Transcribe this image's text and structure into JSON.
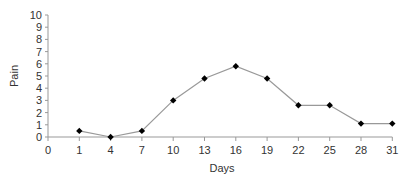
{
  "chart_data": {
    "type": "line",
    "title": "",
    "xlabel": "Days",
    "ylabel": "Pain",
    "categories": [
      "0",
      "1",
      "4",
      "7",
      "10",
      "13",
      "16",
      "19",
      "22",
      "25",
      "28",
      "31"
    ],
    "series": [
      {
        "name": "Pain",
        "x": [
          "1",
          "4",
          "7",
          "10",
          "13",
          "16",
          "19",
          "22",
          "25",
          "28",
          "31"
        ],
        "values": [
          0.5,
          0.0,
          0.5,
          3.0,
          4.8,
          5.8,
          4.8,
          2.6,
          2.6,
          1.1,
          1.1
        ],
        "color": "#999999",
        "marker": "diamond",
        "marker_color": "#000000"
      }
    ],
    "ylim": [
      0,
      10
    ],
    "yticks": [
      0,
      1,
      2,
      3,
      4,
      5,
      6,
      7,
      8,
      9,
      10
    ],
    "grid": false,
    "legend": "none"
  }
}
